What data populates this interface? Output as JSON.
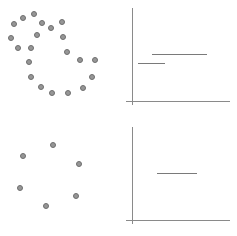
{
  "figure": {
    "width": 237,
    "height": 236,
    "background": "#ffffff",
    "layout": "2x2 panel grid: left column scatter point patterns, right column axis plots with horizontal step segments",
    "panels": [
      {
        "id": "top-left",
        "name": "scatter-top-left",
        "type": "scatter",
        "x": 0,
        "y": 0,
        "width": 118,
        "height": 118
      },
      {
        "id": "top-right",
        "name": "axes-top-right",
        "type": "step",
        "x": 118,
        "y": 0,
        "width": 119,
        "height": 118
      },
      {
        "id": "bottom-left",
        "name": "scatter-bottom-left",
        "type": "scatter",
        "x": 0,
        "y": 118,
        "width": 118,
        "height": 118
      },
      {
        "id": "bottom-right",
        "name": "axes-bottom-right",
        "type": "step",
        "x": 118,
        "y": 118,
        "width": 119,
        "height": 118
      }
    ]
  },
  "style": {
    "dot_fill": "#969696",
    "dot_stroke": "#6e6e6e",
    "dot_diameter": 6,
    "axis_color": "#8a8a8a",
    "segment_color": "#7a7a7a"
  },
  "chart_data": [
    {
      "type": "scatter",
      "id": "top-left",
      "title": "",
      "xlabel": "",
      "ylabel": "",
      "xlim": [
        0,
        118
      ],
      "ylim": [
        0,
        118
      ],
      "grid": false,
      "legend": null,
      "n_points": 21,
      "description": "Two overlapping ring-shaped point clusters: a small ring in the upper-left and a larger open C-shaped ring sweeping right and down",
      "points": [
        {
          "x": 23,
          "y": 18
        },
        {
          "x": 14,
          "y": 24
        },
        {
          "x": 34,
          "y": 14
        },
        {
          "x": 11,
          "y": 38
        },
        {
          "x": 42,
          "y": 23
        },
        {
          "x": 18,
          "y": 48
        },
        {
          "x": 31,
          "y": 48
        },
        {
          "x": 37,
          "y": 35
        },
        {
          "x": 51,
          "y": 28
        },
        {
          "x": 29,
          "y": 62
        },
        {
          "x": 62,
          "y": 22
        },
        {
          "x": 63,
          "y": 37
        },
        {
          "x": 67,
          "y": 52
        },
        {
          "x": 31,
          "y": 77
        },
        {
          "x": 80,
          "y": 60
        },
        {
          "x": 95,
          "y": 60
        },
        {
          "x": 41,
          "y": 87
        },
        {
          "x": 92,
          "y": 77
        },
        {
          "x": 52,
          "y": 93
        },
        {
          "x": 68,
          "y": 93
        },
        {
          "x": 83,
          "y": 88
        }
      ]
    },
    {
      "type": "step",
      "id": "top-right",
      "title": "",
      "xlabel": "",
      "ylabel": "",
      "xlim": [
        0,
        119
      ],
      "ylim": [
        0,
        118
      ],
      "grid": false,
      "legend": null,
      "axes": {
        "vertical": {
          "x": 132,
          "y_top": 8,
          "y_bottom": 105
        },
        "horizontal": {
          "y": 101,
          "x_left": 126,
          "x_right": 230
        }
      },
      "segments": [
        {
          "label": "upper-step",
          "x_start": 152,
          "x_end": 207,
          "y": 54
        },
        {
          "label": "lower-step",
          "x_start": 138,
          "x_end": 165,
          "y": 63
        }
      ]
    },
    {
      "type": "scatter",
      "id": "bottom-left",
      "title": "",
      "xlabel": "",
      "ylabel": "",
      "xlim": [
        0,
        118
      ],
      "ylim": [
        0,
        118
      ],
      "grid": false,
      "legend": null,
      "n_points": 6,
      "description": "Six points arranged loosely around a ring",
      "points": [
        {
          "x": 53,
          "y": 27
        },
        {
          "x": 23,
          "y": 38
        },
        {
          "x": 79,
          "y": 46
        },
        {
          "x": 20,
          "y": 70
        },
        {
          "x": 76,
          "y": 78
        },
        {
          "x": 46,
          "y": 88
        }
      ]
    },
    {
      "type": "step",
      "id": "bottom-right",
      "title": "",
      "xlabel": "",
      "ylabel": "",
      "xlim": [
        0,
        119
      ],
      "ylim": [
        0,
        118
      ],
      "grid": false,
      "legend": null,
      "axes": {
        "vertical": {
          "x": 132,
          "y_top": 127,
          "y_bottom": 224
        },
        "horizontal": {
          "y": 220,
          "x_left": 126,
          "x_right": 230
        }
      },
      "segments": [
        {
          "label": "single-step",
          "x_start": 157,
          "x_end": 197,
          "y": 173
        }
      ]
    }
  ]
}
